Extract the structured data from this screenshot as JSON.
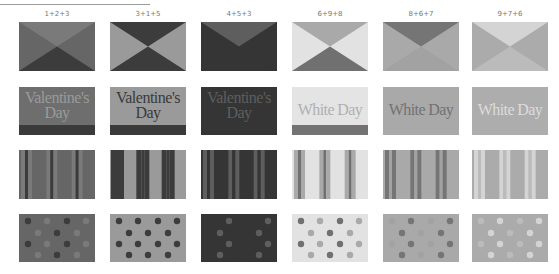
{
  "columns": [
    {
      "label": "1+2+3",
      "colors": {
        "a": "#7a7a7a",
        "b": "#666666",
        "c": "#3c3c3c"
      }
    },
    {
      "label": "3+1+5",
      "colors": {
        "a": "#3c3c3c",
        "b": "#9a9a9a",
        "c": "#3c3c3c"
      }
    },
    {
      "label": "4+5+3",
      "colors": {
        "a": "#5e5e5e",
        "b": "#353535",
        "c": "#353535"
      }
    },
    {
      "label": "6+9+8",
      "colors": {
        "a": "#a9a9a9",
        "b": "#e2e2e2",
        "c": "#707070"
      }
    },
    {
      "label": "8+6+7",
      "colors": {
        "a": "#757575",
        "b": "#a9a9a9",
        "c": "#a2a2a2"
      }
    },
    {
      "label": "9+7+6",
      "colors": {
        "a": "#d4d4d4",
        "b": "#ababab",
        "c": "#bbbbbb"
      }
    }
  ],
  "rows": {
    "valentine": {
      "line1": "Valentine's",
      "line2": "Day",
      "tiles": [
        {
          "bg": "#6e6e6e",
          "text": "#9a9a9a",
          "band": "#3a3a3a"
        },
        {
          "bg": "#9a9a9a",
          "text": "#3a3a3a",
          "band": "#3a3a3a"
        },
        {
          "bg": "#353535",
          "text": "#5e5e5e",
          "band": "#353535"
        }
      ]
    },
    "whiteday": {
      "text": "White Day",
      "tiles": [
        {
          "bg": "#e4e4e4",
          "text": "#b0b0b0",
          "band": "#737373"
        },
        {
          "bg": "#a9a9a9",
          "text": "#727272",
          "band": "#a9a9a9"
        },
        {
          "bg": "#adadad",
          "text": "#dcdcdc",
          "band": "#adadad"
        }
      ]
    }
  }
}
